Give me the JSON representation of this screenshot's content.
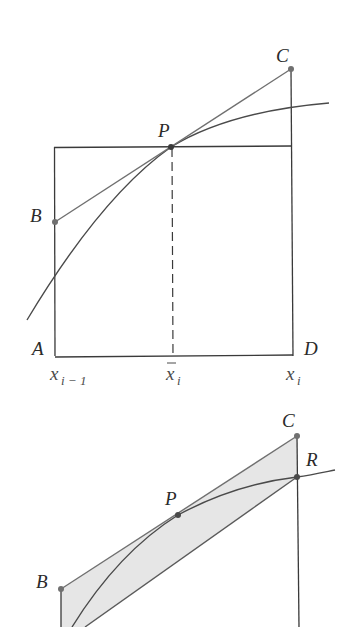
{
  "figure_top": {
    "labels": {
      "A": "A",
      "B": "B",
      "C": "C",
      "D": "D",
      "P": "P"
    },
    "axis_labels": {
      "left": {
        "base": "x",
        "sub": "i − 1"
      },
      "mid": {
        "base": "x",
        "sub": "i"
      },
      "right": {
        "base": "x",
        "sub": "i"
      }
    }
  },
  "figure_bottom": {
    "labels": {
      "B": "B",
      "C": "C",
      "P": "P",
      "R": "R"
    }
  },
  "colors": {
    "line": "#3a3a3a",
    "tangent": "#6e6e6e",
    "point": "#707070",
    "shade": "#e6e6e6"
  }
}
